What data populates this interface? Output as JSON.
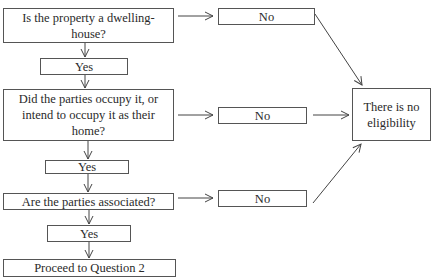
{
  "diagram": {
    "type": "flowchart",
    "questions": [
      {
        "id": "q1",
        "text": "Is the property a dwelling-house?",
        "yes": "Yes",
        "no": "No"
      },
      {
        "id": "q2",
        "text": "Did the parties occupy it, or intend to occupy it as their home?",
        "yes": "Yes",
        "no": "No"
      },
      {
        "id": "q3",
        "text": "Are the parties associated?",
        "yes": "Yes",
        "no": "No"
      }
    ],
    "outcome_negative": "There is no eligibility",
    "outcome_positive": "Proceed to Question 2",
    "colors": {
      "line": "#444444",
      "border": "#555555",
      "background": "#ffffff"
    }
  }
}
